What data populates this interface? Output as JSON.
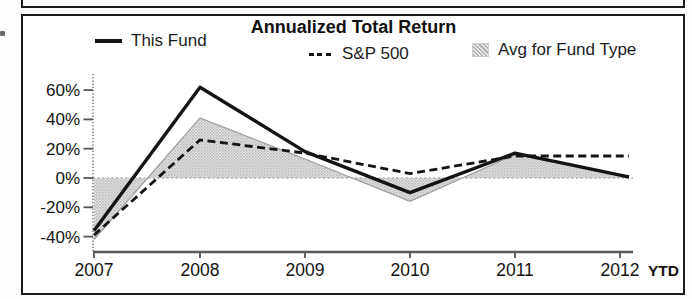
{
  "chart": {
    "title": "Annualized Total Return",
    "legend": {
      "this_fund": "This Fund",
      "sp500": "S&P 500",
      "avg": "Avg for Fund Type"
    }
  },
  "chart_data": {
    "type": "line",
    "title": "Annualized Total Return",
    "categories": [
      "2007",
      "2008",
      "2009",
      "2010",
      "2011",
      "2012"
    ],
    "x_suffix": "YTD",
    "y_tick_labels": [
      "60%",
      "40%",
      "20%",
      "0%",
      "-20%",
      "-40%"
    ],
    "y_tick_values": [
      60,
      40,
      20,
      0,
      -20,
      -40
    ],
    "ylim": [
      -52,
      68
    ],
    "unit": "percent",
    "grid": "zero-baseline-dotted-only",
    "legend_position": "top",
    "series": [
      {
        "name": "This Fund",
        "type": "line",
        "style": "solid",
        "color": "#141414",
        "values": [
          -36,
          62,
          18,
          -10,
          17,
          2
        ]
      },
      {
        "name": "S&P 500",
        "type": "line",
        "style": "dashed",
        "color": "#141414",
        "values": [
          -39,
          26,
          17,
          3,
          15,
          15
        ]
      },
      {
        "name": "Avg for Fund Type",
        "type": "area",
        "style": "halftone-gray",
        "color": "#c9c9c9",
        "baseline": 0,
        "values": [
          -42,
          41,
          13,
          -16,
          16,
          2
        ]
      }
    ]
  }
}
